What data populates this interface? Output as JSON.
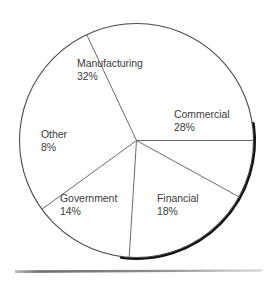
{
  "chart_data": {
    "type": "pie",
    "title": "",
    "subtitle": "",
    "xlabel": "",
    "ylabel": "",
    "legend_position": "none",
    "grid": false,
    "value_unit": "%",
    "total": 100,
    "categories": [
      "Manufacturing",
      "Commercial",
      "Financial",
      "Government",
      "Other"
    ],
    "values": [
      32,
      28,
      18,
      14,
      8
    ],
    "slices": [
      {
        "name": "Manufacturing",
        "value": 32,
        "value_label": "32%",
        "start_angle": 244.8,
        "end_angle": 360.0,
        "label_x": 77,
        "label_y": 57
      },
      {
        "name": "Commercial",
        "value": 28,
        "value_label": "28%",
        "start_angle": 0.0,
        "end_angle": 28.8,
        "label_x": 174,
        "label_y": 108
      },
      {
        "name": "Financial",
        "value": 18,
        "value_label": "18%",
        "start_angle": 28.8,
        "end_angle": 93.6,
        "label_x": 157,
        "label_y": 192
      },
      {
        "name": "Government",
        "value": 14,
        "value_label": "14%",
        "start_angle": 93.6,
        "end_angle": 144.0,
        "label_x": 60,
        "label_y": 192
      },
      {
        "name": "Other",
        "value": 8,
        "value_label": "8%",
        "start_angle": 144.0,
        "end_angle": 244.8,
        "label_x": 41,
        "label_y": 128
      }
    ],
    "geometry": {
      "center_x": 136.5,
      "center_y": 140.5,
      "radius": 117
    },
    "style": {
      "outline_color": "#4a4a4a",
      "shadow_color": "#111111",
      "spoke_color": "#5a5a5a",
      "label_color": "#3b3b3b",
      "background": "#ffffff",
      "baseline_rule_color": "#9a9a9a"
    }
  }
}
